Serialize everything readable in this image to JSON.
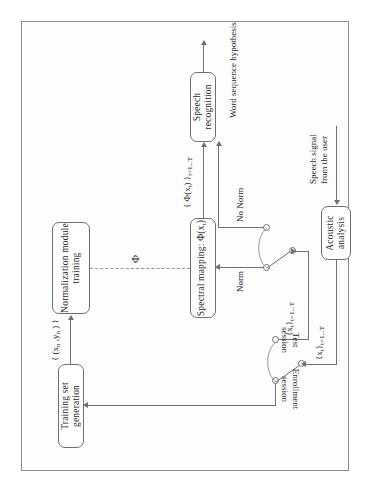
{
  "diagram": {
    "rotation_deg": -90,
    "boxes": [
      {
        "id": "training-set-generation",
        "label": "Training set generation"
      },
      {
        "id": "normalization-module-training",
        "label": "Normalization module\ntraining",
        "line1": "Normalization module",
        "line2": "training"
      },
      {
        "id": "spectral-mapping",
        "label": "Spectral mapping: Φ(xₜ)",
        "prefix": "Spectral mapping: ",
        "fn": "Φ(x",
        "sub": "t",
        "suffix": ")"
      },
      {
        "id": "speech-recognition",
        "label": "Speech  recognition"
      },
      {
        "id": "acoustic-analysis",
        "label": "Acoustic\nanalysis",
        "line1": "Acoustic",
        "line2": "analysis"
      }
    ],
    "edge_labels": {
      "training_pairs": "{ (xₙ ,yₙ ) }",
      "training_pairs_parts": {
        "open": "{ (x",
        "sub1": "n",
        "mid": " ,y",
        "sub2": "n",
        "close": " ) }"
      },
      "phi": "Φ",
      "features_enroll": "{xₜ}ₜ₌₁‥ₜ",
      "features_enroll_parts": {
        "open": "{x",
        "sub": "t",
        "close": "}",
        "range": "t=1...T"
      },
      "features_test": "{xₜ}ₜ₌₁‥ₜ",
      "mapped_features": "{ Φ(xₜ) }ₜ₌₁‥ₜ",
      "mapped_features_parts": {
        "open": "{ Φ(x",
        "sub": "t",
        "close": ") }",
        "range": "t=1...T"
      },
      "norm": "Norm",
      "no_norm": "No Norm",
      "enrollment_session": "Enrollment\nsession",
      "enrollment_session_line1": "Enrollment",
      "enrollment_session_line2": "session",
      "test_session": "Test\nsession",
      "test_session_line1": "Test",
      "test_session_line2": "session",
      "input_signal_line1": "Speech signal",
      "input_signal_line2": "from the user",
      "output_hypothesis": "Word  sequence hypothesis"
    },
    "colors": {
      "stroke": "#6f6f6f",
      "dashed_stroke": "#9a9a9a",
      "text": "#272727",
      "page_border": "#8d8d8d",
      "background": "#ffffff"
    }
  }
}
